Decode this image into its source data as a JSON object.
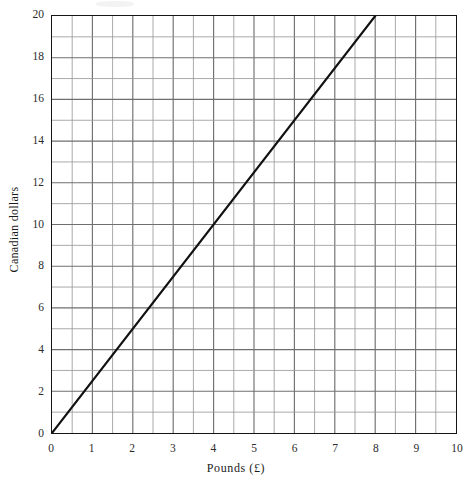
{
  "chart_data": {
    "type": "line",
    "title": "",
    "subtitle": "",
    "xlabel": "Pounds  (£)",
    "ylabel": "Canadian dollars",
    "xlim": [
      0,
      10
    ],
    "ylim": [
      0,
      20
    ],
    "x_major_step": 1,
    "x_minor_step": 0.5,
    "y_major_step": 2,
    "y_grid_step": 1,
    "grid": true,
    "legend": "none",
    "x_tick_labels": [
      "0",
      "1",
      "2",
      "3",
      "4",
      "5",
      "6",
      "7",
      "8",
      "9",
      "10"
    ],
    "x_tick_values": [
      0,
      1,
      2,
      3,
      4,
      5,
      6,
      7,
      8,
      9,
      10
    ],
    "y_tick_labels": [
      "0",
      "2",
      "4",
      "6",
      "8",
      "10",
      "12",
      "14",
      "16",
      "18",
      "20"
    ],
    "y_tick_values": [
      0,
      2,
      4,
      6,
      8,
      10,
      12,
      14,
      16,
      18,
      20
    ],
    "series": [
      {
        "name": "Conversion line",
        "rate_dollars_per_pound": 2.5,
        "x": [
          0,
          8
        ],
        "values": [
          0,
          20
        ],
        "points": [
          [
            0,
            0
          ],
          [
            1,
            2.5
          ],
          [
            2,
            5
          ],
          [
            3,
            7.5
          ],
          [
            4,
            10
          ],
          [
            5,
            12.5
          ],
          [
            6,
            15
          ],
          [
            7,
            17.5
          ],
          [
            8,
            20
          ]
        ],
        "color": "#111111",
        "width_px": 2.2
      }
    ],
    "annotations": []
  },
  "style": {
    "background": "#ffffff",
    "frame_color": "#151515",
    "grid_major_color": "#6f6f6f",
    "grid_minor_color": "#9a9a9a",
    "text_color": "#1a1a1a"
  }
}
